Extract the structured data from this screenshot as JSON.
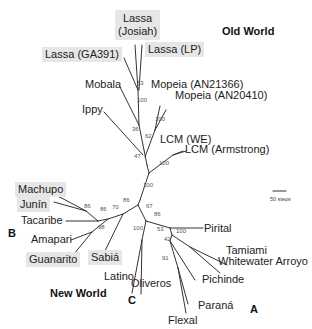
{
  "regions": {
    "old_world": "Old World",
    "new_world": "New World"
  },
  "clades": {
    "a": "A",
    "b": "B",
    "c": "C"
  },
  "scale": {
    "label": "50 steps"
  },
  "colors": {
    "branch": "#333333",
    "highlight": "#e6e6e6",
    "text": "#222222"
  },
  "taxa": {
    "lassa_josiah": "Lassa\n(Josiah)",
    "lassa_josiah_l1": "Lassa",
    "lassa_josiah_l2": "(Josiah)",
    "lassa_ga391": "Lassa (GA391)",
    "lassa_lp": "Lassa (LP)",
    "mobala": "Mobala",
    "mopeia_an21366": "Mopeia (AN21366)",
    "mopeia_an20410": "Mopeia (AN20410)",
    "ippy": "Ippy",
    "lcm_we": "LCM (WE)",
    "lcm_armstrong": "LCM (Armstrong)",
    "machupo": "Machupo",
    "junin": "Junín",
    "tacaribe": "Tacaribe",
    "amapari": "Amapari",
    "guanarito": "Guanarito",
    "sabia": "Sabiá",
    "latino": "Latino",
    "oliveros": "Oliveros",
    "pirital": "Pirital",
    "tamiami": "Tamiami",
    "whitewater_arroyo": "Whitewater Arroyo",
    "pichinde": "Pichinde",
    "parana": "Paraná",
    "flexal": "Flexal"
  },
  "bootstrap": {
    "b53_lassa": "53",
    "b100_lassa_mobala": "100",
    "b100_mopeia": "100",
    "b36": "36",
    "b62": "62",
    "b47": "47",
    "b100_lcm": "100",
    "b100_root": "100",
    "b86_nw": "86",
    "b67": "67",
    "b86_machupo_junin": "86",
    "b86_tacaribe": "86",
    "b70": "70",
    "b98": "98",
    "b100_c": "100",
    "b86_a": "86",
    "b53_a": "53",
    "b100_tam_ww": "100",
    "b42": "42",
    "b91": "91"
  },
  "highlighted_taxa": [
    "Lassa (Josiah)",
    "Lassa (GA391)",
    "Lassa (LP)",
    "Machupo",
    "Junín",
    "Guanarito",
    "Sabiá"
  ]
}
